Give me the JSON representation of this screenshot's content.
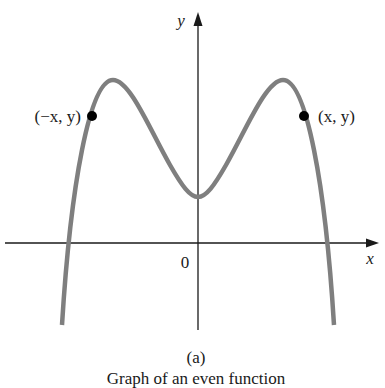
{
  "figure": {
    "sublabel": "(a)",
    "caption": "Graph of an even function",
    "axes": {
      "x_label": "x",
      "y_label": "y",
      "origin_label": "0"
    },
    "points": [
      {
        "label": "(−x, y)",
        "side": "left"
      },
      {
        "label": "(x, y)",
        "side": "right"
      }
    ],
    "colors": {
      "curve": "#7f7f7f",
      "axes": "#1a1a1a",
      "points": "#000000",
      "background": "#ffffff"
    }
  }
}
